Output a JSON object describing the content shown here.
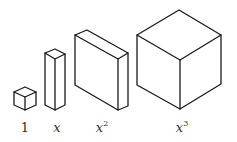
{
  "diagram": {
    "stroke_color": "#1a1a1a",
    "background": "#ffffff",
    "items": [
      {
        "id": "unit-cube",
        "label": "1",
        "base": "1",
        "exponent": ""
      },
      {
        "id": "rod",
        "label": "x",
        "base": "x",
        "exponent": ""
      },
      {
        "id": "flat",
        "label": "x2",
        "base": "x",
        "exponent": "2"
      },
      {
        "id": "cube",
        "label": "x3",
        "base": "x",
        "exponent": "3"
      }
    ]
  }
}
